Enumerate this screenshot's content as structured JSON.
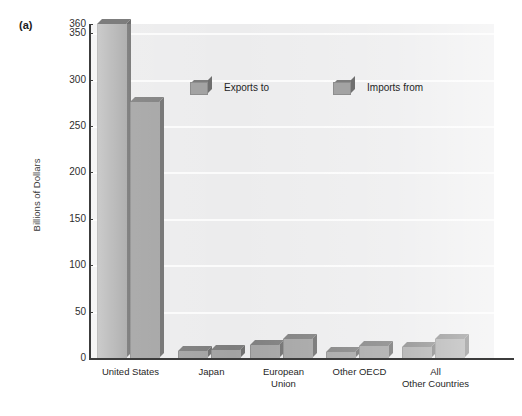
{
  "panel": {
    "letter": "(a)"
  },
  "legend": {
    "entries": [
      {
        "label": "Exports to",
        "icon": "cube-swatch-icon"
      },
      {
        "label": "Imports from",
        "icon": "cube-swatch-icon"
      }
    ]
  },
  "axes": {
    "y_title": "Billions of Dollars",
    "y_ticks": [
      "360",
      "350",
      "300",
      "250",
      "200",
      "150",
      "100",
      "50",
      "0"
    ]
  },
  "chart_data": {
    "type": "bar",
    "title": "",
    "xlabel": "",
    "ylabel": "Billions of Dollars",
    "ylim": [
      0,
      360
    ],
    "yticks": [
      0,
      50,
      100,
      150,
      200,
      250,
      300,
      350,
      360
    ],
    "grid": true,
    "legend_position": "inside-top-center",
    "categories": [
      "United States",
      "Japan",
      "European Union",
      "Other OECD",
      "All Other Countries"
    ],
    "series": [
      {
        "name": "Exports to",
        "values": [
          360,
          8,
          14,
          6,
          12
        ]
      },
      {
        "name": "Imports from",
        "values": [
          276,
          9,
          20,
          13,
          20
        ]
      }
    ]
  },
  "colors": {
    "bar_face": "#a3a3a3",
    "bar_top": "#7d7d7d",
    "bar_side": "#6f6f6f",
    "plot_background": "#ececed",
    "gridline": "#fbfbfb",
    "axis": "#3c3c3c",
    "text": "#1f1f1f"
  }
}
